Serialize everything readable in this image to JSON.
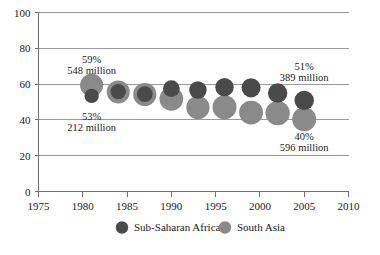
{
  "chart_data": {
    "type": "scatter",
    "title": "",
    "subtitle": "",
    "xlabel": "",
    "ylabel": "",
    "xlim": [
      1975,
      2010
    ],
    "ylim": [
      0,
      100
    ],
    "grid": true,
    "legend_position": "bottom",
    "x_ticks": [
      "1975",
      "1980",
      "1985",
      "1990",
      "1995",
      "2000",
      "2005",
      "2010"
    ],
    "x_tick_values": [
      1975,
      1980,
      1985,
      1990,
      1995,
      2000,
      2005,
      2010
    ],
    "y_ticks": [
      "0",
      "20",
      "40",
      "60",
      "80",
      "100"
    ],
    "y_tick_values": [
      0,
      20,
      40,
      60,
      80,
      100
    ],
    "series": [
      {
        "name": "Sub-Saharan Africa",
        "color": "#4a4a4a",
        "points": [
          {
            "x": 1981,
            "y": 53.4,
            "size": 212
          },
          {
            "x": 1984,
            "y": 55.8,
            "size": 242
          },
          {
            "x": 1987,
            "y": 54.4,
            "size": 258
          },
          {
            "x": 1990,
            "y": 57.5,
            "size": 290
          },
          {
            "x": 1993,
            "y": 56.7,
            "size": 317
          },
          {
            "x": 1996,
            "y": 58.3,
            "size": 350
          },
          {
            "x": 1999,
            "y": 57.9,
            "size": 378
          },
          {
            "x": 2002,
            "y": 55.0,
            "size": 390
          },
          {
            "x": 2005,
            "y": 50.9,
            "size": 389
          }
        ]
      },
      {
        "name": "South Asia",
        "color": "#8a8a8a",
        "points": [
          {
            "x": 1981,
            "y": 59.4,
            "size": 548
          },
          {
            "x": 1984,
            "y": 55.6,
            "size": 548
          },
          {
            "x": 1987,
            "y": 54.2,
            "size": 554
          },
          {
            "x": 1990,
            "y": 51.7,
            "size": 579
          },
          {
            "x": 1993,
            "y": 46.9,
            "size": 559
          },
          {
            "x": 1996,
            "y": 47.1,
            "size": 594
          },
          {
            "x": 1999,
            "y": 44.1,
            "size": 589
          },
          {
            "x": 2002,
            "y": 43.8,
            "size": 616
          },
          {
            "x": 2005,
            "y": 40.3,
            "size": 596
          }
        ]
      }
    ],
    "annotations": [
      {
        "id": "sa-1981",
        "pct": "59%",
        "value": "548 million",
        "x": 1981,
        "y": 72,
        "align": "center"
      },
      {
        "id": "ssa-1981",
        "pct": "53%",
        "value": "212 million",
        "x": 1981,
        "y": 40,
        "align": "center"
      },
      {
        "id": "ssa-2005",
        "pct": "51%",
        "value": "389 million",
        "x": 2005,
        "y": 68,
        "align": "center"
      },
      {
        "id": "sa-2005",
        "pct": "40%",
        "value": "596 million",
        "x": 2005,
        "y": 29,
        "align": "center"
      }
    ]
  },
  "legend": {
    "items": [
      {
        "label": "Sub-Saharan Africa",
        "color": "#4a4a4a",
        "marker": "circle-marker"
      },
      {
        "label": "South Asia",
        "color": "#8a8a8a",
        "marker": "circle-marker"
      }
    ]
  },
  "colors": {
    "sub_saharan_africa": "#4a4a4a",
    "south_asia": "#8a8a8a",
    "axis": "#6e6e6e",
    "grid": "#9a9a9a",
    "text": "#1a1a1a",
    "background": "#ffffff"
  }
}
